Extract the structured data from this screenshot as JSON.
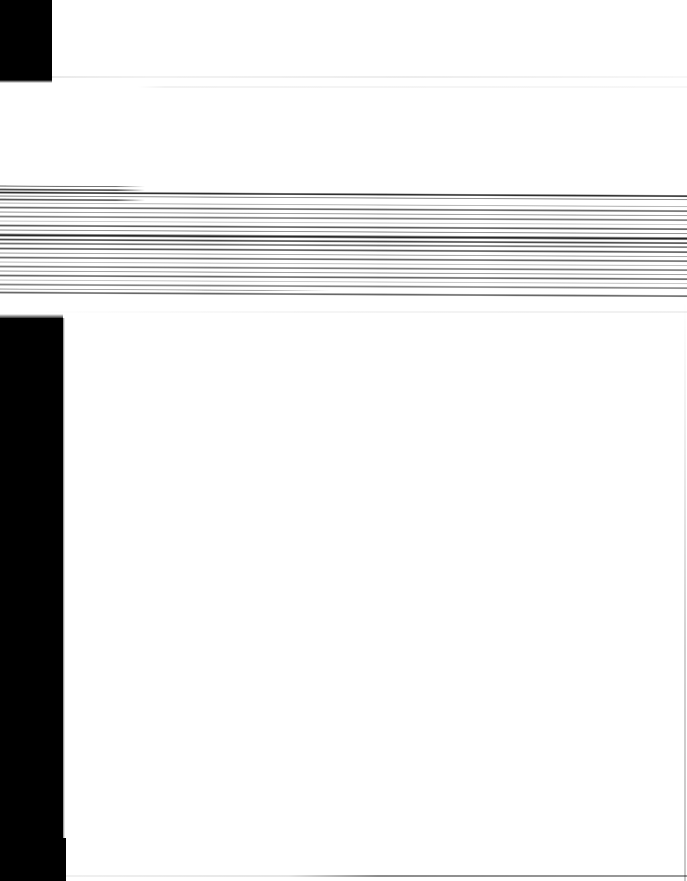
{
  "capture": {
    "width": 687,
    "height": 881,
    "background_color": "#ffffff",
    "condition": "heavily horizontally smeared / motion-blurred screenshot; no legible text present"
  },
  "regions": {
    "top_left_block": {
      "name": "top-left-black-block",
      "x": 0,
      "y": 0,
      "width": 52,
      "height": 80,
      "color": "#000000"
    },
    "left_sidebar_band": {
      "name": "left-black-sidebar-band",
      "x": 0,
      "y": 318,
      "width": 63,
      "height": 563,
      "color": "#000000"
    },
    "left_sidebar_foot": {
      "name": "left-black-sidebar-foot",
      "x": 0,
      "y": 838,
      "width": 66,
      "height": 43,
      "color": "#000000"
    },
    "streak_band": {
      "name": "smeared-content-band",
      "x": 0,
      "y": 183,
      "width": 687,
      "height": 114,
      "description": "dense stack of horizontal dark streaks, content illegible",
      "split_x": 145,
      "skew_degrees": 0.3
    },
    "content_area": {
      "name": "white-content-area",
      "x": 63,
      "y": 297,
      "width": 624,
      "height": 584,
      "color": "#ffffff"
    }
  },
  "hairlines": [
    {
      "name": "hairline-top-a",
      "y": 76,
      "opacity": 0.1
    },
    {
      "name": "hairline-top-b",
      "y": 86,
      "opacity": 0.05
    },
    {
      "name": "hairline-mid",
      "y": 311,
      "opacity": 0.06
    },
    {
      "name": "hairline-bottom",
      "y": 875,
      "opacity": 0.45
    }
  ],
  "right_edge_line": {
    "name": "right-vertical-hairline",
    "x": 685,
    "y": 300,
    "height": 581,
    "opacity": 0.22
  },
  "streaks": [
    {
      "top": 2,
      "height": 2,
      "gray": "#6a6a6a",
      "left_only": true,
      "right_edge": 145
    },
    {
      "top": 5,
      "height": 3,
      "gray": "#3c3c3c",
      "left_only": true,
      "right_edge": 145
    },
    {
      "top": 8,
      "height": 3,
      "gray": "#1c1c1c",
      "left_only": false,
      "right_edge": 687
    },
    {
      "top": 12,
      "height": 2,
      "gray": "#8a8a8a",
      "left_only": false,
      "right_edge": 687
    },
    {
      "top": 15,
      "height": 3,
      "gray": "#4a4a4a",
      "left_only": true,
      "right_edge": 145
    },
    {
      "top": 19,
      "height": 2,
      "gray": "#b4b4b4",
      "left_only": false,
      "right_edge": 687
    },
    {
      "top": 23,
      "height": 3,
      "gray": "#5c5c5c",
      "left_only": false,
      "right_edge": 687
    },
    {
      "top": 28,
      "height": 2,
      "gray": "#9a9a9a",
      "left_only": false,
      "right_edge": 687
    },
    {
      "top": 32,
      "height": 3,
      "gray": "#707070",
      "left_only": false,
      "right_edge": 687
    },
    {
      "top": 37,
      "height": 2,
      "gray": "#c8c8c8",
      "left_only": false,
      "right_edge": 687
    },
    {
      "top": 41,
      "height": 3,
      "gray": "#4e4e4e",
      "left_only": false,
      "right_edge": 687
    },
    {
      "top": 46,
      "height": 2,
      "gray": "#8e8e8e",
      "left_only": false,
      "right_edge": 687
    },
    {
      "top": 50,
      "height": 4,
      "gray": "#141414",
      "left_only": false,
      "right_edge": 687
    },
    {
      "top": 55,
      "height": 3,
      "gray": "#3a3a3a",
      "left_only": false,
      "right_edge": 687
    },
    {
      "top": 59,
      "height": 3,
      "gray": "#666666",
      "left_only": false,
      "right_edge": 687
    },
    {
      "top": 64,
      "height": 3,
      "gray": "#4c4c4c",
      "left_only": false,
      "right_edge": 687
    },
    {
      "top": 69,
      "height": 2,
      "gray": "#a2a2a2",
      "left_only": false,
      "right_edge": 687
    },
    {
      "top": 73,
      "height": 3,
      "gray": "#5e5e5e",
      "left_only": false,
      "right_edge": 687
    },
    {
      "top": 78,
      "height": 2,
      "gray": "#bdbdbd",
      "left_only": false,
      "right_edge": 687
    },
    {
      "top": 82,
      "height": 3,
      "gray": "#6e6e6e",
      "left_only": false,
      "right_edge": 687
    },
    {
      "top": 87,
      "height": 2,
      "gray": "#9c9c9c",
      "left_only": false,
      "right_edge": 687
    },
    {
      "top": 91,
      "height": 3,
      "gray": "#5a5a5a",
      "left_only": false,
      "right_edge": 687
    },
    {
      "top": 96,
      "height": 2,
      "gray": "#c4c4c4",
      "left_only": false,
      "right_edge": 687
    },
    {
      "top": 100,
      "height": 3,
      "gray": "#787878",
      "left_only": false,
      "right_edge": 687
    },
    {
      "top": 105,
      "height": 2,
      "gray": "#9e9e9e",
      "left_only": true,
      "right_edge": 330
    },
    {
      "top": 108,
      "height": 3,
      "gray": "#5a5a5a",
      "left_only": false,
      "right_edge": 687
    }
  ]
}
